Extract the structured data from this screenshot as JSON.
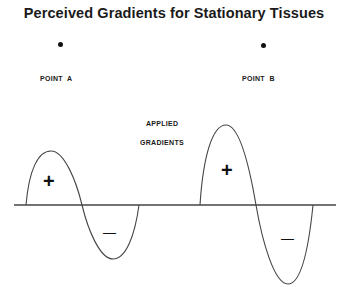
{
  "title": "Perceived Gradients for Stationary Tissues",
  "points": [
    {
      "label": "POINT  A",
      "dot_x": 60,
      "dot_y": 44
    },
    {
      "label": "POINT  B",
      "dot_x": 263,
      "dot_y": 45
    }
  ],
  "center_label": {
    "line1": "APPLIED",
    "line2": "GRADIENTS"
  },
  "waveforms": [
    {
      "name": "left-gradient-wave",
      "start_x": 26,
      "cross_x": 82,
      "end_x": 139,
      "peak": [
        51,
        151
      ],
      "trough": [
        113,
        259
      ],
      "positive_sign": "+",
      "negative_sign": "—"
    },
    {
      "name": "right-gradient-wave",
      "start_x": 200,
      "cross_x": 256,
      "end_x": 313,
      "peak": [
        226,
        125
      ],
      "trough": [
        288,
        284
      ],
      "positive_sign": "+",
      "negative_sign": "—"
    }
  ],
  "axis": {
    "y": 205,
    "x_start": 14,
    "x_end": 336
  },
  "colors": {
    "line": "#333333",
    "text": "#1a1a1a",
    "background": "#ffffff"
  }
}
